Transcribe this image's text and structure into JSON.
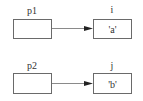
{
  "diagram": {
    "type": "pointer-diagram",
    "rows": [
      {
        "pointer": {
          "label": "p1",
          "value": ""
        },
        "target": {
          "label": "i",
          "value": "'a'"
        }
      },
      {
        "pointer": {
          "label": "p2",
          "value": ""
        },
        "target": {
          "label": "j",
          "value": "'b'"
        }
      }
    ],
    "colors": {
      "box_border": "#6a6a6a",
      "arrow_line": "#8a8a8a",
      "arrow_head": "#222222",
      "text": "#333333",
      "background": "#ffffff"
    }
  }
}
